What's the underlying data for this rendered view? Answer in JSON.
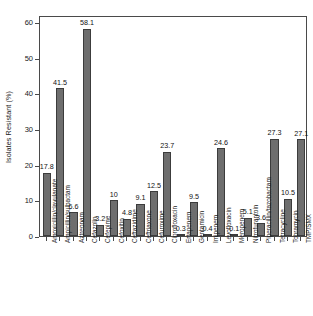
{
  "chart_data": {
    "type": "bar",
    "title": "",
    "subtitle": "",
    "xlabel": "",
    "ylabel": "Isolates Resistant (%)",
    "ylim": [
      0,
      62
    ],
    "yticks": [
      0,
      10,
      20,
      30,
      40,
      50,
      60
    ],
    "grid": false,
    "legend": null,
    "bar_color": "#6e6e6e",
    "bar_edge_color": "#3c3c3c",
    "axis_color": "#4a4a4a",
    "background": "#ffffff",
    "show_value_labels": true,
    "categories": [
      "Amoxicillin/clavulanate",
      "Ampicillin/sulbactam",
      "Aztreonam",
      "Cefazolin",
      "Cefepime",
      "Cefoxitin",
      "Ceftazidime",
      "Ceftriaxone",
      "Cefuroxime",
      "Ciprofloxacin",
      "Ertapenem",
      "Gentamicin",
      "Imipenem",
      "Levofloxacin",
      "Meropenem",
      "Nitrofurantoin",
      "Piperacillin/tazobactam",
      "Tetracycline",
      "Tobramycin",
      "TMP/SMX"
    ],
    "values": [
      17.8,
      41.5,
      6.6,
      58.1,
      3.2,
      10,
      4.8,
      9.1,
      12.5,
      23.7,
      0.3,
      9.5,
      0.4,
      24.6,
      0.1,
      5.1,
      3.6,
      27.3,
      10.5,
      27.1
    ],
    "value_labels": [
      "17.8",
      "41.5",
      "6.6",
      "58.1",
      "3.2",
      "10",
      "4.8",
      "9.1",
      "12.5",
      "23.7",
      "0.3",
      "9.5",
      "0.4",
      "24.6",
      "0.1",
      "5.1",
      "3.6",
      "27.3",
      "10.5",
      "27.1"
    ]
  }
}
